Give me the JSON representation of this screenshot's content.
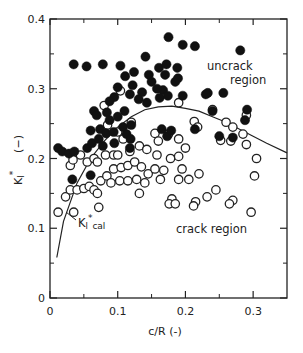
{
  "chart_data": {
    "type": "scatter",
    "title": "",
    "xlabel": "c/R (-)",
    "ylabel": "KI* (-)",
    "xlim": [
      0,
      0.35
    ],
    "ylim": [
      0,
      0.4
    ],
    "x_ticks": [
      "0",
      "0.1",
      "0.2",
      "0.3"
    ],
    "y_ticks": [
      "0",
      "0.1",
      "0.2",
      "0.3",
      "0.4"
    ],
    "grid": false,
    "legend": null,
    "annotations": [
      {
        "text": "uncrack",
        "x": 0.245,
        "y": 0.335
      },
      {
        "text": "region",
        "x": 0.27,
        "y": 0.313
      },
      {
        "text": "crack region",
        "x": 0.245,
        "y": 0.128
      },
      {
        "text": "KI*cal",
        "x": 0.04,
        "y": 0.107
      }
    ],
    "series": [
      {
        "name": "uncrack (filled)",
        "marker": "filled-circle",
        "points": [
          [
            0.035,
            0.335
          ],
          [
            0.054,
            0.332
          ],
          [
            0.078,
            0.335
          ],
          [
            0.104,
            0.333
          ],
          [
            0.124,
            0.324
          ],
          [
            0.141,
            0.346
          ],
          [
            0.175,
            0.374
          ],
          [
            0.196,
            0.363
          ],
          [
            0.214,
            0.361
          ],
          [
            0.281,
            0.355
          ],
          [
            0.111,
            0.318
          ],
          [
            0.122,
            0.305
          ],
          [
            0.118,
            0.292
          ],
          [
            0.1,
            0.302
          ],
          [
            0.095,
            0.288
          ],
          [
            0.088,
            0.282
          ],
          [
            0.084,
            0.266
          ],
          [
            0.088,
            0.255
          ],
          [
            0.1,
            0.26
          ],
          [
            0.11,
            0.268
          ],
          [
            0.146,
            0.32
          ],
          [
            0.15,
            0.31
          ],
          [
            0.161,
            0.33
          ],
          [
            0.17,
            0.32
          ],
          [
            0.172,
            0.335
          ],
          [
            0.167,
            0.298
          ],
          [
            0.185,
            0.31
          ],
          [
            0.174,
            0.29
          ],
          [
            0.189,
            0.315
          ],
          [
            0.188,
            0.33
          ],
          [
            0.136,
            0.295
          ],
          [
            0.143,
            0.28
          ],
          [
            0.131,
            0.285
          ],
          [
            0.158,
            0.3
          ],
          [
            0.162,
            0.287
          ],
          [
            0.196,
            0.29
          ],
          [
            0.23,
            0.292
          ],
          [
            0.233,
            0.294
          ],
          [
            0.256,
            0.294
          ],
          [
            0.291,
            0.27
          ],
          [
            0.065,
            0.268
          ],
          [
            0.069,
            0.262
          ],
          [
            0.06,
            0.24
          ],
          [
            0.074,
            0.242
          ],
          [
            0.083,
            0.236
          ],
          [
            0.094,
            0.238
          ],
          [
            0.108,
            0.245
          ],
          [
            0.113,
            0.235
          ],
          [
            0.12,
            0.248
          ],
          [
            0.119,
            0.228
          ],
          [
            0.012,
            0.215
          ],
          [
            0.018,
            0.21
          ],
          [
            0.028,
            0.207
          ],
          [
            0.036,
            0.21
          ],
          [
            0.055,
            0.215
          ],
          [
            0.062,
            0.222
          ],
          [
            0.072,
            0.228
          ],
          [
            0.078,
            0.218
          ],
          [
            0.095,
            0.222
          ],
          [
            0.118,
            0.215
          ],
          [
            0.033,
            0.17
          ],
          [
            0.06,
            0.176
          ],
          [
            0.165,
            0.242
          ],
          [
            0.173,
            0.232
          ],
          [
            0.179,
            0.24
          ],
          [
            0.214,
            0.242
          ],
          [
            0.24,
            0.268
          ],
          [
            0.25,
            0.232
          ],
          [
            0.27,
            0.23
          ],
          [
            0.288,
            0.255
          ]
        ]
      },
      {
        "name": "crack (open)",
        "marker": "open-circle",
        "points": [
          [
            0.104,
            0.297
          ],
          [
            0.08,
            0.276
          ],
          [
            0.19,
            0.28
          ],
          [
            0.24,
            0.27
          ],
          [
            0.29,
            0.262
          ],
          [
            0.213,
            0.253
          ],
          [
            0.26,
            0.252
          ],
          [
            0.12,
            0.252
          ],
          [
            0.085,
            0.248
          ],
          [
            0.1,
            0.238
          ],
          [
            0.108,
            0.228
          ],
          [
            0.118,
            0.21
          ],
          [
            0.082,
            0.205
          ],
          [
            0.094,
            0.205
          ],
          [
            0.132,
            0.218
          ],
          [
            0.143,
            0.213
          ],
          [
            0.155,
            0.236
          ],
          [
            0.16,
            0.225
          ],
          [
            0.175,
            0.235
          ],
          [
            0.19,
            0.228
          ],
          [
            0.2,
            0.215
          ],
          [
            0.218,
            0.245
          ],
          [
            0.27,
            0.245
          ],
          [
            0.285,
            0.235
          ],
          [
            0.252,
            0.226
          ],
          [
            0.267,
            0.225
          ],
          [
            0.29,
            0.22
          ],
          [
            0.305,
            0.2
          ],
          [
            0.302,
            0.175
          ],
          [
            0.27,
            0.14
          ],
          [
            0.265,
            0.135
          ],
          [
            0.297,
            0.123
          ],
          [
            0.232,
            0.145
          ],
          [
            0.215,
            0.138
          ],
          [
            0.212,
            0.132
          ],
          [
            0.18,
            0.142
          ],
          [
            0.176,
            0.135
          ],
          [
            0.245,
            0.155
          ],
          [
            0.158,
            0.205
          ],
          [
            0.163,
            0.17
          ],
          [
            0.012,
            0.123
          ],
          [
            0.035,
            0.123
          ],
          [
            0.072,
            0.13
          ],
          [
            0.023,
            0.145
          ],
          [
            0.03,
            0.155
          ],
          [
            0.04,
            0.155
          ],
          [
            0.05,
            0.157
          ],
          [
            0.058,
            0.16
          ],
          [
            0.065,
            0.155
          ],
          [
            0.075,
            0.168
          ],
          [
            0.084,
            0.175
          ],
          [
            0.094,
            0.185
          ],
          [
            0.105,
            0.187
          ],
          [
            0.115,
            0.19
          ],
          [
            0.125,
            0.195
          ],
          [
            0.135,
            0.188
          ],
          [
            0.145,
            0.178
          ],
          [
            0.09,
            0.165
          ],
          [
            0.103,
            0.168
          ],
          [
            0.115,
            0.168
          ],
          [
            0.128,
            0.17
          ],
          [
            0.14,
            0.165
          ],
          [
            0.055,
            0.195
          ],
          [
            0.065,
            0.2
          ],
          [
            0.07,
            0.195
          ],
          [
            0.045,
            0.205
          ],
          [
            0.03,
            0.19
          ],
          [
            0.034,
            0.198
          ],
          [
            0.178,
            0.2
          ],
          [
            0.19,
            0.203
          ],
          [
            0.195,
            0.185
          ],
          [
            0.155,
            0.185
          ],
          [
            0.168,
            0.183
          ],
          [
            0.132,
            0.15
          ],
          [
            0.185,
            0.135
          ],
          [
            0.1,
            0.205
          ],
          [
            0.07,
            0.15
          ],
          [
            0.19,
            0.17
          ],
          [
            0.205,
            0.17
          ],
          [
            0.22,
            0.178
          ]
        ]
      },
      {
        "name": "KI*cal",
        "marker": "line",
        "points": [
          [
            0.01,
            0.058
          ],
          [
            0.02,
            0.11
          ],
          [
            0.04,
            0.165
          ],
          [
            0.06,
            0.2
          ],
          [
            0.08,
            0.225
          ],
          [
            0.1,
            0.245
          ],
          [
            0.12,
            0.26
          ],
          [
            0.14,
            0.27
          ],
          [
            0.16,
            0.274
          ],
          [
            0.18,
            0.275
          ],
          [
            0.2,
            0.272
          ],
          [
            0.22,
            0.268
          ],
          [
            0.24,
            0.26
          ],
          [
            0.26,
            0.252
          ],
          [
            0.28,
            0.242
          ],
          [
            0.3,
            0.232
          ],
          [
            0.32,
            0.222
          ],
          [
            0.35,
            0.208
          ]
        ]
      }
    ]
  }
}
